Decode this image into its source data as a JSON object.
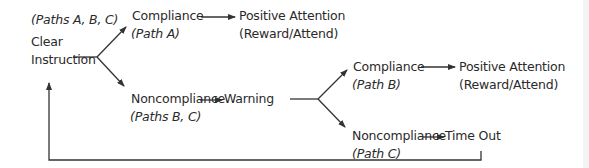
{
  "diagram": {
    "type": "flowchart",
    "colors": {
      "line": "#333333",
      "text": "#2a2a2a",
      "background": "#ffffff"
    },
    "nodes": {
      "start": {
        "paths_note": "(Paths A, B, C)",
        "line1": "Clear",
        "line2": "Instruction"
      },
      "compliance_a": {
        "label": "Compliance",
        "path": "(Path A)"
      },
      "positive_a": {
        "line1": "Positive Attention",
        "line2": "(Reward/Attend)"
      },
      "noncompliance_bc": {
        "label": "Noncompliance",
        "path": "(Paths B, C)"
      },
      "warning": {
        "label": "Warning"
      },
      "compliance_b": {
        "label": "Compliance",
        "path": "(Path B)"
      },
      "positive_b": {
        "line1": "Positive Attention",
        "line2": "(Reward/Attend)"
      },
      "noncompliance_c": {
        "label": "Noncompliance",
        "path": "(Path C)"
      },
      "timeout": {
        "label": "Time Out"
      }
    },
    "edges": [
      {
        "from": "Clear Instruction",
        "to": "Compliance (Path A)"
      },
      {
        "from": "Clear Instruction",
        "to": "Noncompliance (Paths B, C)"
      },
      {
        "from": "Compliance (Path A)",
        "to": "Positive Attention (Reward/Attend)"
      },
      {
        "from": "Noncompliance (Paths B, C)",
        "to": "Warning"
      },
      {
        "from": "Warning",
        "to": "Compliance (Path B)"
      },
      {
        "from": "Warning",
        "to": "Noncompliance (Path C)"
      },
      {
        "from": "Compliance (Path B)",
        "to": "Positive Attention (Reward/Attend)"
      },
      {
        "from": "Noncompliance (Path C)",
        "to": "Time Out"
      },
      {
        "from": "Time Out",
        "to": "Clear Instruction"
      }
    ]
  }
}
